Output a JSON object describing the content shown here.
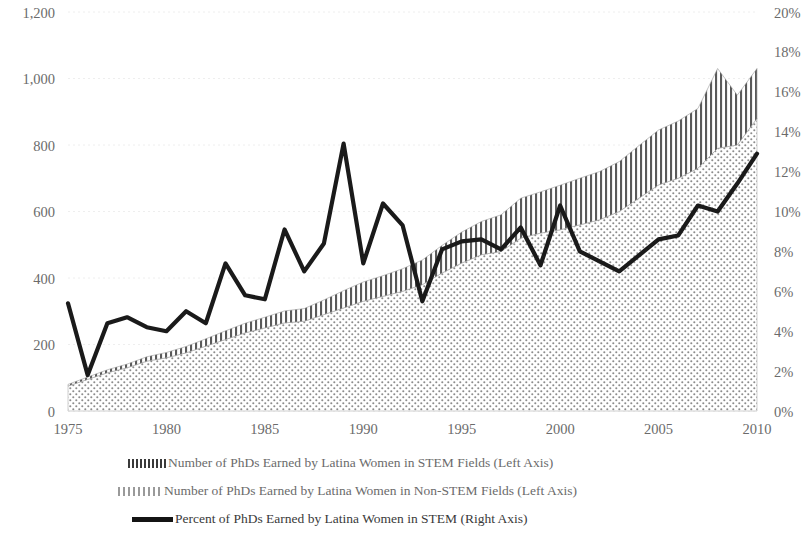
{
  "chart_data": {
    "type": "area",
    "title": "",
    "subtitle": "",
    "xlabel": "",
    "ylabel": "",
    "y2label": "",
    "grid": true,
    "legend_position": "bottom",
    "x": [
      1975,
      1976,
      1977,
      1978,
      1979,
      1980,
      1981,
      1982,
      1983,
      1984,
      1985,
      1986,
      1987,
      1988,
      1989,
      1990,
      1991,
      1992,
      1993,
      1994,
      1995,
      1996,
      1997,
      1998,
      1999,
      2000,
      2001,
      2002,
      2003,
      2004,
      2005,
      2006,
      2007,
      2008,
      2009,
      2010
    ],
    "xlim": [
      1975,
      2010
    ],
    "xticks": [
      "1975",
      "1980",
      "1985",
      "1990",
      "1995",
      "2000",
      "2005",
      "2010"
    ],
    "ylim": [
      0,
      1200
    ],
    "yticks": [
      "0",
      "200",
      "400",
      "600",
      "800",
      "1,000",
      "1,200"
    ],
    "y2lim": [
      0,
      20
    ],
    "y2ticks": [
      "0%",
      "2%",
      "4%",
      "6%",
      "8%",
      "10%",
      "12%",
      "14%",
      "16%",
      "18%",
      "20%"
    ],
    "series": [
      {
        "name": "Number of PhDs Earned by Latina Women in Non-STEM Fields (Left Axis)",
        "short_name": "non-stem",
        "axis": "left",
        "style": "dotted-area",
        "stack": "bottom",
        "values": [
          75,
          95,
          115,
          130,
          150,
          160,
          175,
          195,
          215,
          235,
          250,
          265,
          270,
          290,
          310,
          330,
          345,
          360,
          380,
          415,
          445,
          470,
          480,
          520,
          535,
          545,
          560,
          575,
          600,
          640,
          680,
          700,
          730,
          790,
          800,
          880
        ]
      },
      {
        "name": "Number of PhDs Earned by Latina Women in STEM Fields (Left Axis)",
        "short_name": "stem",
        "axis": "left",
        "style": "hatched-area",
        "stack": "top",
        "values": [
          5,
          7,
          9,
          11,
          13,
          16,
          19,
          22,
          26,
          29,
          32,
          36,
          38,
          44,
          52,
          58,
          62,
          68,
          74,
          83,
          93,
          100,
          110,
          120,
          124,
          134,
          140,
          145,
          150,
          158,
          165,
          172,
          180,
          240,
          150,
          150
        ]
      },
      {
        "name": "Percent of PhDs Earned by Latina Women in STEM (Right Axis)",
        "short_name": "percent-stem",
        "axis": "right",
        "style": "solid-line",
        "values": [
          5.4,
          1.8,
          4.4,
          4.7,
          4.2,
          4.0,
          5.0,
          4.4,
          7.4,
          5.8,
          5.6,
          9.1,
          7.0,
          8.4,
          13.4,
          7.4,
          10.4,
          9.3,
          5.5,
          8.1,
          8.5,
          8.6,
          8.1,
          9.2,
          7.3,
          10.3,
          8.0,
          7.5,
          7.0,
          7.8,
          8.6,
          8.8,
          10.3,
          10.0,
          11.4,
          12.9
        ]
      }
    ]
  },
  "legend": {
    "items": [
      {
        "label": "Number of PhDs Earned by Latina Women in STEM Fields (Left Axis)",
        "swatch": "hatch-swatch-icon"
      },
      {
        "label": "Number of PhDs Earned by Latina Women in Non-STEM Fields (Left Axis)",
        "swatch": "dot-swatch-icon"
      },
      {
        "label": "Percent of PhDs Earned by Latina Women in STEM (Right Axis)",
        "swatch": "line-swatch-icon"
      }
    ]
  },
  "colors": {
    "line": "#1a1a1a",
    "text": "#6b6b6b",
    "grid": "#eeeeee",
    "hatch": "#555555",
    "dots": "#888888"
  }
}
